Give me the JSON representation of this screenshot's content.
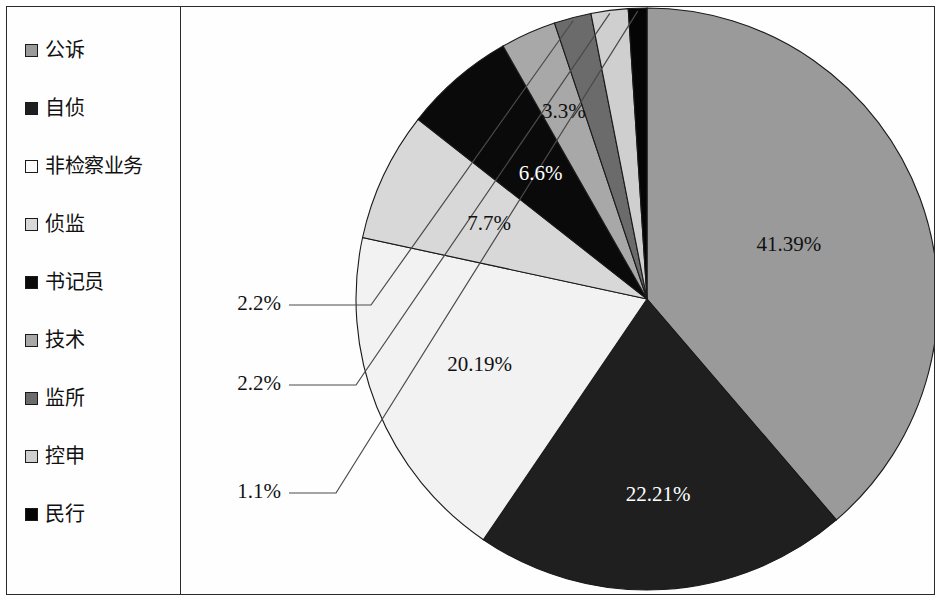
{
  "chart_data": {
    "type": "pie",
    "title": "",
    "subtitle": "",
    "xlabel": "",
    "ylabel": "",
    "legend_position": "left",
    "grid": false,
    "value_unit": "percent",
    "categories": [
      "公诉",
      "自侦",
      "非检察业务",
      "侦监",
      "书记员",
      "技术",
      "监所",
      "控申",
      "民行"
    ],
    "values": [
      41.39,
      22.21,
      20.19,
      7.7,
      6.6,
      3.3,
      2.2,
      2.2,
      1.1
    ],
    "labels": [
      "41.39%",
      "22.21%",
      "20.19%",
      "7.7%",
      "6.6%",
      "3.3%",
      "2.2%",
      "2.2%",
      "1.1%"
    ],
    "colors": [
      "#9a9a9a",
      "#1f1f1f",
      "#f2f2f2",
      "#d8d8d8",
      "#0a0a0a",
      "#a8a8a8",
      "#6b6b6b",
      "#cfcfcf",
      "#050505"
    ],
    "slice_order_clockwise_from_top": [
      "公诉",
      "自侦",
      "非检察业务",
      "侦监",
      "书记员",
      "技术",
      "监所",
      "控申",
      "民行"
    ],
    "start_angle_deg": 0,
    "callout_labels": [
      "1.1%",
      "2.2%",
      "2.2%"
    ],
    "inline_labels": [
      "41.39%",
      "22.21%",
      "20.19%",
      "7.7%",
      "6.6%",
      "3.3%"
    ]
  },
  "legend": {
    "items": [
      {
        "label": "公诉",
        "color": "#9a9a9a",
        "value": 41.39
      },
      {
        "label": "自侦",
        "color": "#1f1f1f",
        "value": 22.21
      },
      {
        "label": "非检察业务",
        "color": "#fcfcfc",
        "value": 20.19
      },
      {
        "label": "侦监",
        "color": "#d8d8d8",
        "value": 7.7
      },
      {
        "label": "书记员",
        "color": "#0a0a0a",
        "value": 6.6
      },
      {
        "label": "技术",
        "color": "#a8a8a8",
        "value": 3.3
      },
      {
        "label": "监所",
        "color": "#6b6b6b",
        "value": 2.2
      },
      {
        "label": "控申",
        "color": "#cfcfcf",
        "value": 2.2
      },
      {
        "label": "民行",
        "color": "#050505",
        "value": 1.1
      }
    ]
  },
  "pie": {
    "slices": [
      {
        "name": "公诉",
        "pct": 41.39,
        "label": "41.39%",
        "color": "#9a9a9a",
        "label_fill": "dark",
        "callout": false
      },
      {
        "name": "自侦",
        "pct": 22.21,
        "label": "22.21%",
        "color": "#1f1f1f",
        "label_fill": "light",
        "callout": false
      },
      {
        "name": "非检察业务",
        "pct": 20.19,
        "label": "20.19%",
        "color": "#f2f2f2",
        "label_fill": "dark",
        "callout": false
      },
      {
        "name": "侦监",
        "pct": 7.7,
        "label": "7.7%",
        "color": "#d8d8d8",
        "label_fill": "dark",
        "callout": false
      },
      {
        "name": "书记员",
        "pct": 6.6,
        "label": "6.6%",
        "color": "#0a0a0a",
        "label_fill": "light",
        "callout": false
      },
      {
        "name": "技术",
        "pct": 3.3,
        "label": "3.3%",
        "color": "#a8a8a8",
        "label_fill": "dark",
        "callout": false
      },
      {
        "name": "监所",
        "pct": 2.2,
        "label": "2.2%",
        "color": "#6b6b6b",
        "label_fill": "dark",
        "callout": true
      },
      {
        "name": "控申",
        "pct": 2.2,
        "label": "2.2%",
        "color": "#cfcfcf",
        "label_fill": "dark",
        "callout": true
      },
      {
        "name": "民行",
        "pct": 1.1,
        "label": "1.1%",
        "color": "#050505",
        "label_fill": "dark",
        "callout": true
      }
    ]
  }
}
